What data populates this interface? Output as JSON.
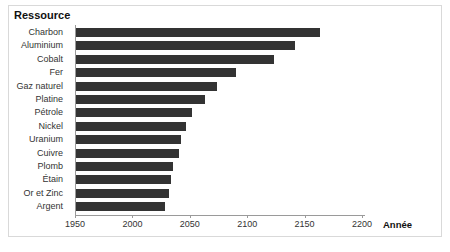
{
  "chart_data": {
    "type": "bar",
    "orientation": "horizontal",
    "title": "Ressource",
    "xlabel": "Année",
    "ylabel": "Ressource",
    "xlim": [
      1950,
      2210
    ],
    "grid": false,
    "legend": null,
    "bar_color": "#333333",
    "axis_color": "#9a9a9a",
    "xticks": [
      1950,
      2000,
      2050,
      2100,
      2150,
      2200
    ],
    "xticklabels": [
      "1950",
      "2000",
      "2050",
      "2100",
      "2150",
      "2200"
    ],
    "categories": [
      "Charbon",
      "Aluminium",
      "Cobalt",
      "Fer",
      "Gaz naturel",
      "Platine",
      "Pétrole",
      "Nickel",
      "Uranium",
      "Cuivre",
      "Plomb",
      "Étain",
      "Or et Zinc",
      "Argent"
    ],
    "values": [
      2163,
      2142,
      2123,
      2090,
      2074,
      2063,
      2052,
      2047,
      2042,
      2041,
      2035,
      2034,
      2032,
      2028
    ],
    "bar_start": 1950
  }
}
